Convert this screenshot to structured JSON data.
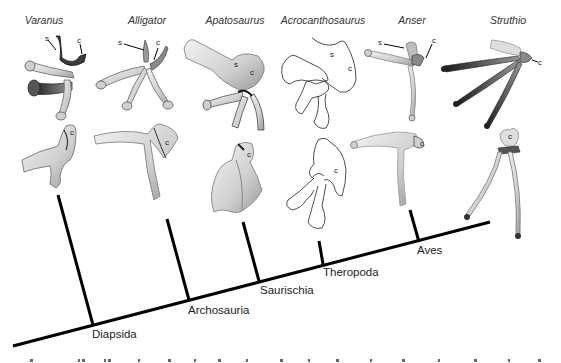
{
  "figure": {
    "taxa": [
      {
        "name": "Varanus",
        "labels": [
          "s",
          "c"
        ],
        "style": "photo"
      },
      {
        "name": "Alligator",
        "labels": [
          "s",
          "c"
        ],
        "style": "photo"
      },
      {
        "name": "Apatosaurus",
        "labels": [
          "s",
          "c"
        ],
        "style": "photo"
      },
      {
        "name": "Acrocanthosaurus",
        "labels": [
          "s",
          "c"
        ],
        "style": "line-drawing"
      },
      {
        "name": "Anser",
        "labels": [
          "s",
          "c"
        ],
        "style": "photo"
      },
      {
        "name": "Struthio",
        "labels": [
          "c"
        ],
        "style": "photo"
      }
    ],
    "lower_row_labels": [
      "c",
      "c",
      "c",
      "c",
      "c",
      "c"
    ],
    "clades": [
      "Diapsida",
      "Archosauria",
      "Saurischia",
      "Theropoda",
      "Aves"
    ],
    "caption_partial": "(caption text cut off at bottom edge)",
    "colors": {
      "branch": "#000000",
      "bone_light": "#e4e4e4",
      "bone_mid": "#b8b8b8",
      "bone_dark": "#3a3a3a",
      "outline": "#222222"
    }
  }
}
